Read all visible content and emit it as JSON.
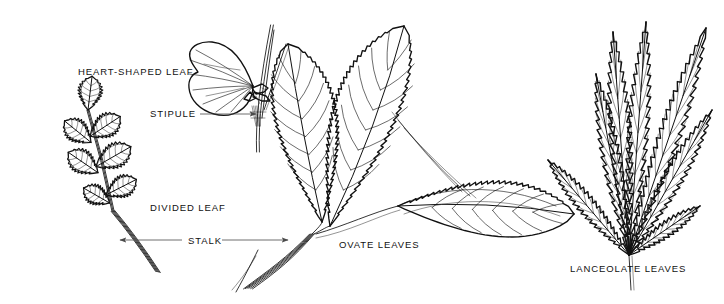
{
  "figure": {
    "background_color": "#ffffff",
    "ink_color": "#111111",
    "leader_color": "#4a4a4a",
    "width": 724,
    "height": 304
  },
  "labels": [
    {
      "id": "heart-shaped-leaf",
      "text": "HEART-SHAPED LEAF",
      "x": 78,
      "y": 75,
      "anchor": "start"
    },
    {
      "id": "stipule",
      "text": "STIPULE",
      "x": 150,
      "y": 117,
      "anchor": "start"
    },
    {
      "id": "divided-leaf",
      "text": "DIVIDED LEAF",
      "x": 150,
      "y": 211,
      "anchor": "start"
    },
    {
      "id": "stalk",
      "text": "STALK",
      "x": 188,
      "y": 244,
      "anchor": "start"
    },
    {
      "id": "ovate-leaves",
      "text": "OVATE LEAVES",
      "x": 339,
      "y": 248,
      "anchor": "start"
    },
    {
      "id": "lanceolate-leaves",
      "text": "LANCEOLATE LEAVES",
      "x": 570,
      "y": 272,
      "anchor": "start"
    }
  ],
  "leaders": [
    {
      "id": "stipule-leader",
      "from": [
        200,
        114
      ],
      "to": [
        256,
        114
      ],
      "arrow": "end"
    },
    {
      "id": "stalk-leader-left",
      "from": [
        182,
        240
      ],
      "to": [
        120,
        240
      ],
      "arrow": "end"
    },
    {
      "id": "stalk-leader-right",
      "from": [
        222,
        240
      ],
      "to": [
        288,
        240
      ],
      "arrow": "end"
    }
  ],
  "specimens": [
    {
      "id": "divided-leaf-specimen",
      "name": "divided-leaf",
      "type": "compound-pinnate",
      "base": [
        113,
        211
      ],
      "rachis_tip": [
        88,
        110
      ],
      "stalk_end": [
        158,
        272
      ],
      "leaflet_count": 7,
      "description": "Pinnately divided leaf with seven deeply lobed, toothed leaflets on a central rachis"
    },
    {
      "id": "heart-shaped-leaf-specimen",
      "name": "heart-shaped-leaf",
      "type": "cordate",
      "attach": [
        253,
        86
      ],
      "stem_top": [
        268,
        25
      ],
      "stem_bottom": [
        258,
        152
      ],
      "description": "Single cordate leaf on an upright stem with a stipule at the leaf base"
    },
    {
      "id": "ovate-leaves-specimen",
      "name": "ovate-leaves",
      "type": "ovate-cluster",
      "base": [
        248,
        288
      ],
      "leaf_count": 3,
      "description": "Three large ovate, sharply serrate leaves radiating from a common curved stalk"
    },
    {
      "id": "lanceolate-leaves-specimen",
      "name": "lanceolate-leaves",
      "type": "lanceolate-cluster",
      "base": [
        629,
        255
      ],
      "leaf_count": 6,
      "description": "Six narrow lanceolate leaves with coarse sharp teeth fanning from a common base"
    }
  ]
}
